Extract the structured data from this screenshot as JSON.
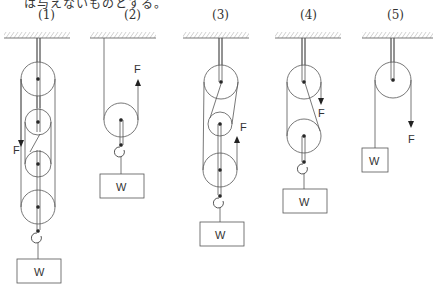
{
  "header": {
    "text": "は与えないものとする。"
  },
  "labels": [
    "(1)",
    "(2)",
    "(3)",
    "(4)",
    "(5)"
  ],
  "force_label": "F",
  "weight_label": "W",
  "diagrams": [
    {
      "id": 1,
      "pulleys": 4,
      "force_direction": "down"
    },
    {
      "id": 2,
      "pulleys": 1,
      "force_direction": "up"
    },
    {
      "id": 3,
      "pulleys": 3,
      "force_direction": "up"
    },
    {
      "id": 4,
      "pulleys": 2,
      "force_direction": "down"
    },
    {
      "id": 5,
      "pulleys": 1,
      "force_direction": "down"
    }
  ],
  "colors": {
    "line": "#555555",
    "text": "#333333"
  }
}
